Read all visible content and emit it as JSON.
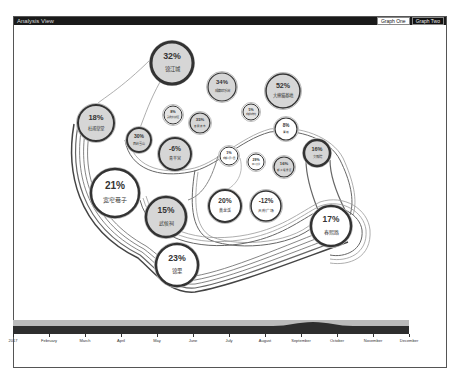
{
  "window": {
    "title": "Analysis View",
    "tabs": [
      {
        "label": "Graph One",
        "active": true
      },
      {
        "label": "Graph Two",
        "active": false
      }
    ]
  },
  "graph": {
    "nodes": [
      {
        "id": "n1",
        "pct": "32%",
        "name": "锦江城",
        "x": 172,
        "y": 63,
        "r": 21,
        "fill": "#d6d6d6",
        "ring": 3
      },
      {
        "id": "n2",
        "pct": "34%",
        "name": "成都欢乐谷",
        "x": 222,
        "y": 87,
        "r": 14,
        "fill": "#d6d6d6",
        "ring": 1.2
      },
      {
        "id": "n3",
        "pct": "52%",
        "name": "大熊猫基地",
        "x": 283,
        "y": 91,
        "r": 17,
        "fill": "#d6d6d6",
        "ring": 1.5
      },
      {
        "id": "n4",
        "pct": "18%",
        "name": "杜甫草堂",
        "x": 96,
        "y": 123,
        "r": 18,
        "fill": "#d6d6d6",
        "ring": 2
      },
      {
        "id": "n5",
        "pct": "8%",
        "name": "武侯文化街区",
        "x": 173,
        "y": 115,
        "r": 9,
        "fill": "#e4e4e4",
        "ring": 1
      },
      {
        "id": "n6",
        "pct": "35%",
        "name": "春熙夜市",
        "x": 200,
        "y": 123,
        "r": 10,
        "fill": "#d6d6d6",
        "ring": 1.2
      },
      {
        "id": "n7",
        "pct": "5%",
        "name": "成都博物馆",
        "x": 251,
        "y": 112,
        "r": 8,
        "fill": "#e4e4e4",
        "ring": 1
      },
      {
        "id": "n8",
        "pct": "30%",
        "name": "西岭雪山",
        "x": 139,
        "y": 140,
        "r": 12,
        "fill": "#d6d6d6",
        "ring": 2
      },
      {
        "id": "n9",
        "pct": "8%",
        "name": "青城",
        "x": 286,
        "y": 129,
        "r": 11,
        "fill": "#fff",
        "ring": 1.2
      },
      {
        "id": "n10",
        "pct": "-6%",
        "name": "青羊宫",
        "x": 175,
        "y": 154,
        "r": 16,
        "fill": "#d6d6d6",
        "ring": 2
      },
      {
        "id": "n11",
        "pct": "16%",
        "name": "文殊院",
        "x": 317,
        "y": 153,
        "r": 13,
        "fill": "#d6d6d6",
        "ring": 2.5
      },
      {
        "id": "n12",
        "pct": "1%",
        "name": "成都人民公园",
        "x": 229,
        "y": 156,
        "r": 9,
        "fill": "#fff",
        "ring": 1
      },
      {
        "id": "n13",
        "pct": "29%",
        "name": "四川大学",
        "x": 256,
        "y": 162,
        "r": 8,
        "fill": "#fff",
        "ring": 1
      },
      {
        "id": "n14",
        "pct": "16%",
        "name": "都江堰景区",
        "x": 284,
        "y": 167,
        "r": 10,
        "fill": "#d6d6d6",
        "ring": 1.2
      },
      {
        "id": "n15",
        "pct": "21%",
        "name": "宽窄巷子",
        "x": 115,
        "y": 193,
        "r": 24,
        "fill": "#fff",
        "ring": 2.5
      },
      {
        "id": "n16",
        "pct": "15%",
        "name": "武侯祠",
        "x": 166,
        "y": 217,
        "r": 20,
        "fill": "#d6d6d6",
        "ring": 2.5
      },
      {
        "id": "n17",
        "pct": "20%",
        "name": "黄龙溪",
        "x": 225,
        "y": 206,
        "r": 16,
        "fill": "#fff",
        "ring": 2
      },
      {
        "id": "n18",
        "pct": "-12%",
        "name": "天府广场",
        "x": 266,
        "y": 206,
        "r": 15,
        "fill": "#fff",
        "ring": 1.5
      },
      {
        "id": "n19",
        "pct": "17%",
        "name": "春熙路",
        "x": 331,
        "y": 226,
        "r": 20,
        "fill": "#fff",
        "ring": 2.5
      },
      {
        "id": "n20",
        "pct": "23%",
        "name": "锦里",
        "x": 177,
        "y": 265,
        "r": 21,
        "fill": "#fff",
        "ring": 2.5
      }
    ]
  },
  "timeline": {
    "labels": [
      "2017",
      "February",
      "March",
      "April",
      "May",
      "June",
      "July",
      "August",
      "September",
      "October",
      "November",
      "December"
    ]
  }
}
